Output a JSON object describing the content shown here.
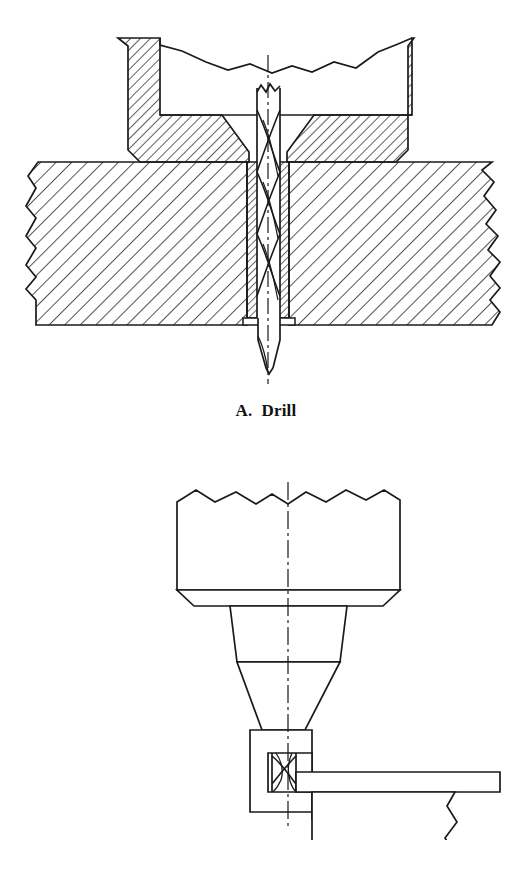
{
  "figure": {
    "background_color": "#ffffff",
    "line_color": "#1a1a1a",
    "panels": [
      {
        "id": "drill",
        "caption": "A.  Drill",
        "label_letter": "A.",
        "label_text": "Drill",
        "description": "Sectional view of a twist drill passing through a drill bushing in a drill jig plate into a workpiece",
        "parts": [
          "drill-jig-plate",
          "drill-bushing",
          "twist-drill-bit",
          "workpiece-stock",
          "center-line"
        ]
      },
      {
        "id": "router",
        "caption": "B.  Router",
        "label_letter": "B.",
        "label_text": "Router",
        "description": "Sectional view of a router spindle with collet and spiral router bit trimming a panel against a guide block",
        "parts": [
          "router-motor-housing",
          "collet-nut",
          "collet-cone",
          "guide-block",
          "router-bit",
          "workpiece-panel",
          "support-block",
          "center-line"
        ]
      }
    ]
  },
  "style_values": {
    "hatch_angle_degrees": 45,
    "stroke_width": 1.6,
    "caption_font_size_px": 17
  }
}
